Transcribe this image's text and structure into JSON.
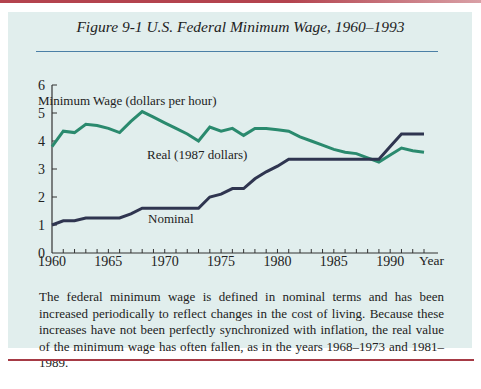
{
  "figure": {
    "title": "Figure 9-1   U.S. Federal Minimum Wage, 1960–1993",
    "caption": "The federal minimum wage is defined in nominal terms and has been increased periodically to reflect changes in the cost of living. Because these increases have not been perfectly synchronized with inflation, the real value of the minimum wage has often fallen, as in the years 1968–1973 and 1981–1989."
  },
  "colors": {
    "panel_bg": "#e1eeed",
    "real_line": "#2a8a6e",
    "nominal_line": "#2f3550",
    "accent_rule": "#b4434e",
    "title_rule": "#4b7fa6"
  },
  "chart_data": {
    "type": "line",
    "title": "U.S. Federal Minimum Wage, 1960–1993",
    "xlabel": "Year",
    "ylabel": "Minimum Wage (dollars per hour)",
    "xlim": [
      1960,
      1994
    ],
    "ylim": [
      0,
      6
    ],
    "x_ticks": [
      1960,
      1965,
      1970,
      1975,
      1980,
      1985,
      1990
    ],
    "y_ticks": [
      0,
      1,
      2,
      3,
      4,
      5,
      6
    ],
    "grid": false,
    "legend": "inline labels",
    "x": [
      1960,
      1961,
      1962,
      1963,
      1964,
      1965,
      1966,
      1967,
      1968,
      1969,
      1970,
      1971,
      1972,
      1973,
      1974,
      1975,
      1976,
      1977,
      1978,
      1979,
      1980,
      1981,
      1982,
      1983,
      1984,
      1985,
      1986,
      1987,
      1988,
      1989,
      1990,
      1991,
      1992,
      1993
    ],
    "series": [
      {
        "name": "Real (1987 dollars)",
        "label": "Real (1987 dollars)",
        "values": [
          3.8,
          4.35,
          4.3,
          4.6,
          4.55,
          4.45,
          4.3,
          4.7,
          5.05,
          4.85,
          4.65,
          4.45,
          4.25,
          4.0,
          4.5,
          4.35,
          4.45,
          4.2,
          4.45,
          4.45,
          4.4,
          4.35,
          4.15,
          4.0,
          3.85,
          3.7,
          3.6,
          3.55,
          3.4,
          3.25,
          3.5,
          3.75,
          3.65,
          3.6
        ]
      },
      {
        "name": "Nominal",
        "label": "Nominal",
        "values": [
          1.0,
          1.15,
          1.15,
          1.25,
          1.25,
          1.25,
          1.25,
          1.4,
          1.6,
          1.6,
          1.6,
          1.6,
          1.6,
          1.6,
          2.0,
          2.1,
          2.3,
          2.3,
          2.65,
          2.9,
          3.1,
          3.35,
          3.35,
          3.35,
          3.35,
          3.35,
          3.35,
          3.35,
          3.35,
          3.35,
          3.8,
          4.25,
          4.25,
          4.25
        ]
      }
    ]
  }
}
